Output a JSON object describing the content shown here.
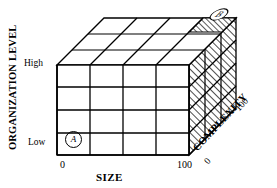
{
  "figure": {
    "kind": "3d-cube-matrix-diagram",
    "line_color": "#000000",
    "fill_color": "#ffffff",
    "hatch_color": "#000000"
  },
  "axes": {
    "y": {
      "title": "ORGANIZATION LEVEL",
      "ticks": [
        "High",
        "Low"
      ],
      "tick_high": "High",
      "tick_low": "Low",
      "divisions": 4
    },
    "x": {
      "title": "SIZE",
      "ticks": [
        "0",
        "100"
      ],
      "tick_min": "0",
      "tick_max": "100",
      "divisions": 4
    },
    "z": {
      "title": "COMPLEXITY",
      "ticks": [
        "0",
        "100"
      ],
      "tick_min": "0",
      "tick_max": "100",
      "divisions": 3
    }
  },
  "markers": [
    {
      "id": "marker-a",
      "label": "A",
      "location": "front face, bottom-left cell (low organization level, small size, low complexity)"
    },
    {
      "id": "marker-b",
      "label": "B",
      "location": "top face, far rear-right cell (high organization level, large size, high complexity)"
    }
  ],
  "highlight": {
    "style": "diagonal-hatch",
    "description": "Hatched cells on the far rear-right column and the right side face indicating region B"
  }
}
